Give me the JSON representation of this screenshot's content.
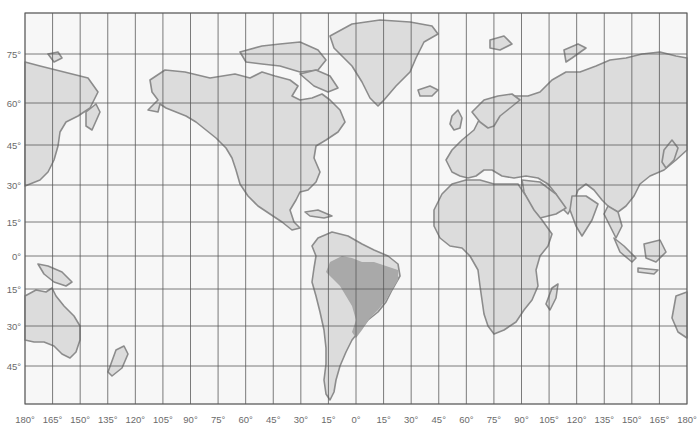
{
  "map": {
    "title": "World map (Mercator-style) with highlighted Brazil",
    "projection": "Mercator",
    "highlighted_region": "Brazil",
    "colors": {
      "background": "#ffffff",
      "ocean": "#f7f7f7",
      "land": "#dcdcdc",
      "coastline": "#8c8c8c",
      "highlight": "#a9a9a9",
      "grid": "#5a5a5a",
      "label": "#6a6a6a"
    },
    "longitude_labels": [
      "180°",
      "165°",
      "150°",
      "135°",
      "120°",
      "105°",
      "90°",
      "75°",
      "60°",
      "45°",
      "30°",
      "15°",
      "0°",
      "15°",
      "30°",
      "45°",
      "60°",
      "75°",
      "90°",
      "105°",
      "120°",
      "135°",
      "150°",
      "165°",
      "180°"
    ],
    "latitude_labels": [
      "75°",
      "60°",
      "45°",
      "30°",
      "15°",
      "0°",
      "15°",
      "30°",
      "45°"
    ],
    "graticule_interval_deg": 15
  }
}
